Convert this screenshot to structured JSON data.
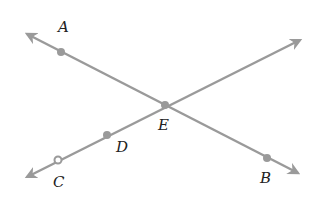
{
  "diagram": {
    "type": "intersecting-lines",
    "line_color": "#9a9a9a",
    "label_color": "#222222",
    "points": {
      "A": {
        "label": "A",
        "x": 61,
        "y": 52,
        "lx": 58,
        "ly": 32
      },
      "B": {
        "label": "B",
        "x": 267,
        "y": 158,
        "lx": 260,
        "ly": 183
      },
      "C": {
        "label": "C",
        "x": 58,
        "y": 160,
        "lx": 53,
        "ly": 187
      },
      "D": {
        "label": "D",
        "x": 107,
        "y": 135,
        "lx": 116,
        "ly": 152
      },
      "E": {
        "label": "E",
        "x": 165,
        "y": 105,
        "lx": 158,
        "ly": 130
      }
    },
    "lines": [
      {
        "name": "line-AB",
        "through": [
          "A",
          "E",
          "B"
        ]
      },
      {
        "name": "line-CD",
        "through": [
          "C",
          "D",
          "E"
        ]
      }
    ]
  }
}
